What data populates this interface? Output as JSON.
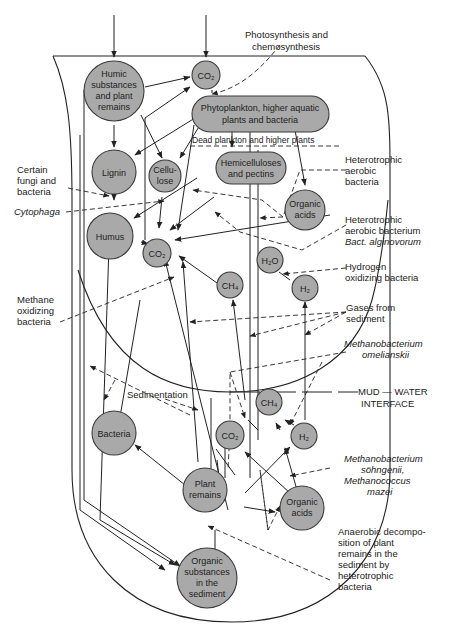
{
  "nodes": {
    "humic": {
      "lines": [
        "Humic",
        "substances",
        "and plant",
        "remains"
      ]
    },
    "co2_top": {
      "lines": [
        "CO₂"
      ]
    },
    "phyto": {
      "lines": [
        "Phytoplankton, higher aquatic",
        "plants and bacteria"
      ]
    },
    "lignin": {
      "lines": [
        "Lignin"
      ]
    },
    "cellulose": {
      "lines": [
        "Cellu-",
        "lose"
      ]
    },
    "hemicellulose": {
      "lines": [
        "Hemicelluloses",
        "and pectins"
      ]
    },
    "organic_acids_top": {
      "lines": [
        "Organic",
        "acids"
      ]
    },
    "humus": {
      "lines": [
        "Humus"
      ]
    },
    "co2_mid": {
      "lines": [
        "CO₂"
      ]
    },
    "h2o": {
      "lines": [
        "H₂O"
      ]
    },
    "ch4_mid": {
      "lines": [
        "CH₄"
      ]
    },
    "h2_mid": {
      "lines": [
        "H₂"
      ]
    },
    "ch4_low": {
      "lines": [
        "CH₄"
      ]
    },
    "co2_low": {
      "lines": [
        "CO₂"
      ]
    },
    "h2_low": {
      "lines": [
        "H₂"
      ]
    },
    "bacteria": {
      "lines": [
        "Bacteria"
      ]
    },
    "plant_remains": {
      "lines": [
        "Plant",
        "remains"
      ]
    },
    "organic_acids_low": {
      "lines": [
        "Organic",
        "acids"
      ]
    },
    "organic_sediment": {
      "lines": [
        "Organic",
        "substances",
        "in the",
        "sediment"
      ]
    }
  },
  "labels": {
    "photosynthesis": [
      "Photosynthesis  and",
      "chemosynthesis"
    ],
    "dead_plankton": "Dead  plankton  and  higher  plants",
    "certain_fungi": [
      "Certain",
      "fungi  and",
      "bacteria"
    ],
    "cytophaga": "Cytophaga",
    "heterotrophic_aerobic": [
      "Heterotrophic",
      "aerobic",
      "bacteria"
    ],
    "heterotrophic_bacterium": [
      "Heterotrophic",
      "aerobic  bacterium"
    ],
    "bact_alginovorum": "Bact.  alginovorum",
    "hydrogen_oxidizing": [
      "Hydrogen",
      "oxidizing  bacteria"
    ],
    "methane_oxidizing": [
      "Methane",
      "oxidizing",
      "bacteria"
    ],
    "gases_from_sediment": [
      "Gases  from",
      "sediment"
    ],
    "methanobacterium_omelianskii": [
      "Methanobacterium",
      "omelianskii"
    ],
    "mud_water": [
      "MUD — WATER",
      "INTERFACE"
    ],
    "sedimentation": "Sedimentation",
    "methanobacterium_sohngenii": [
      "Methanobacterium",
      "söhngenii,",
      "Methanococcus",
      "mazei"
    ],
    "anaerobic": [
      "Anaerobic  decompo-",
      "sition  of  plant",
      "remains  in  the",
      "sediment  by",
      "heterotrophic",
      "bacteria"
    ]
  }
}
